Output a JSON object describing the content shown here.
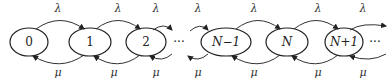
{
  "diagram": {
    "type": "birth-death Markov chain",
    "states": [
      {
        "id": "s0",
        "label": "0",
        "cx": 29
      },
      {
        "id": "s1",
        "label": "1",
        "cx": 90
      },
      {
        "id": "s2",
        "label": "2",
        "cx": 146
      },
      {
        "id": "sNm1",
        "label": "N−1",
        "cx": 226
      },
      {
        "id": "sN",
        "label": "N",
        "cx": 287
      },
      {
        "id": "sNp1",
        "label": "N+1",
        "cx": 344
      }
    ],
    "ellipsis": "···",
    "arrival_rate": "λ",
    "service_rate": "μ",
    "top_labels": [
      "λ",
      "λ",
      "λ",
      "λ",
      "λ",
      "λ",
      "λ"
    ],
    "bottom_labels": [
      "μ",
      "μ",
      "μ",
      "μ",
      "μ",
      "μ",
      "μ"
    ]
  }
}
